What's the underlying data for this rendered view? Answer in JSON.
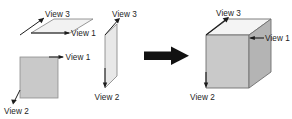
{
  "figure": {
    "type": "diagram",
    "background_color": "#ffffff",
    "ink_color": "#1c1c1c"
  },
  "labels": {
    "view1": "View 1",
    "view2": "View 2",
    "view3": "View 3"
  },
  "left_group": {
    "top_face": {
      "name": "top-parallelogram",
      "fill": "#f2f2f2",
      "stroke": "#7a7a7a",
      "labels": {
        "view3": "View 3",
        "view1": "View 1"
      }
    },
    "front_face": {
      "name": "front-square",
      "fill": "#c9c9c9",
      "stroke": "#8a8a8a",
      "labels": {
        "view1": "View 1",
        "view2": "View 2"
      }
    },
    "side_face": {
      "name": "side-parallelogram",
      "fill": "#e6e6e6",
      "stroke": "#7a7a7a",
      "labels": {
        "view3": "View 3",
        "view2": "View 2"
      }
    }
  },
  "arrow": {
    "name": "transform-arrow",
    "direction": "right",
    "color": "#111111"
  },
  "right_group": {
    "cube": {
      "name": "assembled-cube",
      "top_fill": "#f2f2f2",
      "front_fill": "#c9c9c9",
      "side_fill": "#b3b3b3",
      "stroke": "#6f6f6f",
      "labels": {
        "view3": "View 3",
        "view1": "View 1",
        "view2": "View 2"
      }
    }
  }
}
